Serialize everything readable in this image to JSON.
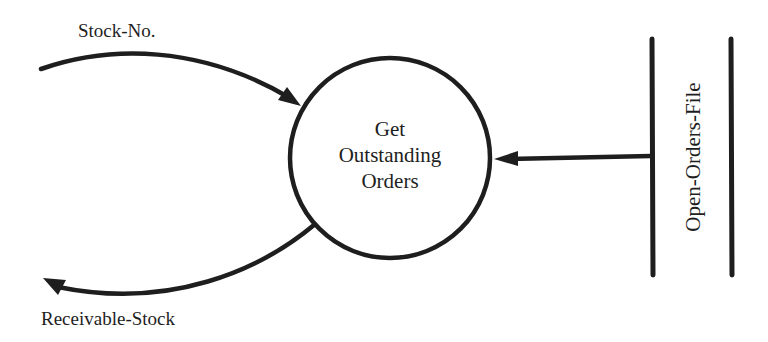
{
  "diagram": {
    "type": "data-flow-diagram",
    "process": {
      "lines": [
        "Get",
        "Outstanding",
        "Orders"
      ]
    },
    "data_store": {
      "label": "Open-Orders-File"
    },
    "flows": [
      {
        "label": "Stock-No.",
        "direction": "in",
        "from": "external",
        "to": "process"
      },
      {
        "label": "Receivable-Stock",
        "direction": "out",
        "from": "process",
        "to": "external"
      },
      {
        "label": "",
        "direction": "in",
        "from": "Open-Orders-File",
        "to": "process"
      }
    ],
    "colors": {
      "ink": "#1e1e1e",
      "background": "#ffffff"
    }
  }
}
